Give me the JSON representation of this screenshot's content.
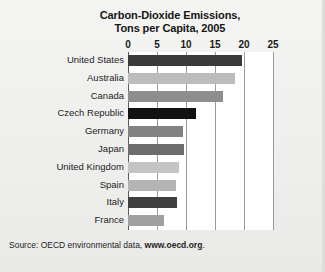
{
  "figure": {
    "title_line1": "Carbon-Dioxide Emissions,",
    "title_line2": "Tons per Capita, 2005",
    "source_prefix": "Source: OECD environmental data, ",
    "source_url": "www.oecd.org",
    "source_suffix": "."
  },
  "chart_data": {
    "type": "bar",
    "orientation": "horizontal",
    "title": "Carbon-Dioxide Emissions, Tons per Capita, 2005",
    "xlabel": "",
    "ylabel": "",
    "xlim": [
      0,
      25
    ],
    "xticks": [
      0,
      5,
      10,
      15,
      20,
      25
    ],
    "xtick_labels": [
      "0",
      "5",
      "10",
      "15",
      "20",
      "25"
    ],
    "grid": true,
    "grid_axis": "x",
    "legend": false,
    "categories": [
      "United States",
      "Australia",
      "Canada",
      "Czech Republic",
      "Germany",
      "Japan",
      "United Kingdom",
      "Spain",
      "Italy",
      "France"
    ],
    "values": [
      19.7,
      18.4,
      16.4,
      11.7,
      9.5,
      9.7,
      8.8,
      8.3,
      8.4,
      6.2
    ],
    "bar_colors": [
      "#3a3a3a",
      "#bcbcbc",
      "#8e8e8e",
      "#121212",
      "#828282",
      "#6c6c6c",
      "#c4c4c4",
      "#b4b4b4",
      "#3f3f3f",
      "#a0a0a0"
    ],
    "source": "Source: OECD environmental data, www.oecd.org."
  }
}
